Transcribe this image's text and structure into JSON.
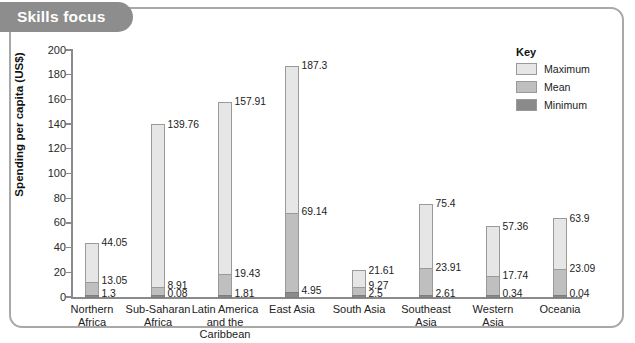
{
  "banner": {
    "title": "Skills focus"
  },
  "chart_data": {
    "type": "bar",
    "title": "",
    "xlabel": "",
    "ylabel": "Spending per capita (US$)",
    "ylim": [
      0,
      200
    ],
    "yticks": [
      0,
      20,
      40,
      60,
      80,
      100,
      120,
      140,
      160,
      180,
      200
    ],
    "grid": false,
    "legend_position": "right",
    "legend_title": "Key",
    "categories": [
      "Northern\nAfrica",
      "Sub-Saharan\nAfrica",
      "Latin America\nand the\nCaribbean",
      "East Asia",
      "South Asia",
      "Southeast\nAsia",
      "Western\nAsia",
      "Oceania"
    ],
    "series": [
      {
        "name": "Maximum",
        "color": "#e6e6e6",
        "values": [
          44.05,
          139.76,
          157.91,
          187.3,
          21.61,
          75.4,
          57.36,
          63.9
        ]
      },
      {
        "name": "Mean",
        "color": "#bfbfbf",
        "values": [
          13.05,
          8.91,
          19.43,
          69.14,
          9.27,
          23.91,
          17.74,
          23.09
        ]
      },
      {
        "name": "Minimum",
        "color": "#8a8a8a",
        "values": [
          1.3,
          0.08,
          1.81,
          4.95,
          2.5,
          2.61,
          0.34,
          0.04
        ]
      }
    ],
    "value_labels": {
      "maximum": [
        "44.05",
        "139.76",
        "157.91",
        "187.3",
        "21.61",
        "75.4",
        "57.36",
        "63.9"
      ],
      "mean": [
        "13.05",
        "8.91",
        "19.43",
        "69.14",
        "9.27",
        "23.91",
        "17.74",
        "23.09"
      ],
      "minimum": [
        "1.3",
        "0.08",
        "1.81",
        "4.95",
        "2.5",
        "2.61",
        "0.34",
        "0.04"
      ]
    },
    "tick_labels": [
      "0",
      "20",
      "40",
      "60",
      "80",
      "100",
      "120",
      "140",
      "160",
      "180",
      "200"
    ]
  },
  "legend": {
    "title": "Key",
    "items": [
      {
        "label": "Maximum",
        "color": "#e6e6e6"
      },
      {
        "label": "Mean",
        "color": "#bfbfbf"
      },
      {
        "label": "Minimum",
        "color": "#8a8a8a"
      }
    ]
  }
}
